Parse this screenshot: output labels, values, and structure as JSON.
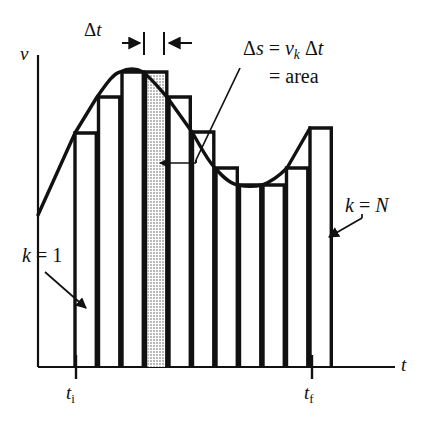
{
  "figure": {
    "kind": "velocity-time-riemann-sum",
    "title_visible": false,
    "background_color": "#ffffff",
    "ink_color": "#111111",
    "shaded_column_fill": "#c9c9c9"
  },
  "axes": {
    "vertical_axis_label": "v",
    "horizontal_axis_label": "t",
    "origin_px": [
      38,
      367
    ],
    "vertical_axis_top_px": 55,
    "horizontal_axis_right_px": 395,
    "grid": "none",
    "tick_labels": [
      "tᵢ",
      "t_f"
    ]
  },
  "annotations": {
    "delta_t": {
      "text_parts": [
        "Δ",
        "t"
      ],
      "text": "Δt",
      "description": "width of one strip, marked with opposing arrows"
    },
    "delta_s_line1": {
      "text": "Δs = vₖ Δt",
      "parts": [
        "Δs",
        "=",
        "v",
        "k",
        "Δt"
      ]
    },
    "delta_s_line2": {
      "text": "= area"
    },
    "k_first": {
      "text": "k = 1",
      "description": "label for first rectangle, with arrow"
    },
    "k_last": {
      "text": "k = N",
      "description": "label for last rectangle, with arrow"
    },
    "t_initial": {
      "base": "t",
      "subscript": "i",
      "text": "tᵢ"
    },
    "t_final": {
      "base": "t",
      "subscript": "f",
      "text": "t_f"
    }
  },
  "chart_data": {
    "type": "bar",
    "title": "",
    "xlabel": "t",
    "ylabel": "v",
    "grid": false,
    "legend": "none",
    "x_axis_ticks": [
      "tᵢ",
      "t_f"
    ],
    "n_rectangles": 11,
    "strip_width_label": "Δt",
    "highlighted_index": 3,
    "highlight_label": "Δs = vₖ Δt = area",
    "first_label": "k = 1",
    "last_label": "k = N",
    "x_left_px": 75,
    "x_right_px": 310,
    "baseline_px": 367,
    "categories": [
      "1",
      "2",
      "3",
      "4",
      "5",
      "6",
      "7",
      "8",
      "9",
      "10",
      "11"
    ],
    "bar_top_px": [
      133,
      97,
      72,
      72,
      97,
      132,
      168,
      185,
      185,
      168,
      128
    ],
    "values": [
      0.72,
      0.86,
      0.95,
      0.95,
      0.86,
      0.74,
      0.62,
      0.56,
      0.56,
      0.62,
      0.75
    ],
    "curve_label": "v(t)",
    "curve_points_px": [
      [
        38,
        215
      ],
      [
        75,
        133
      ],
      [
        97,
        97
      ],
      [
        120,
        72
      ],
      [
        132,
        67
      ],
      [
        143,
        72
      ],
      [
        167,
        97
      ],
      [
        192,
        132
      ],
      [
        215,
        168
      ],
      [
        238,
        185
      ],
      [
        250,
        188
      ],
      [
        262,
        185
      ],
      [
        287,
        168
      ],
      [
        310,
        128
      ]
    ]
  }
}
